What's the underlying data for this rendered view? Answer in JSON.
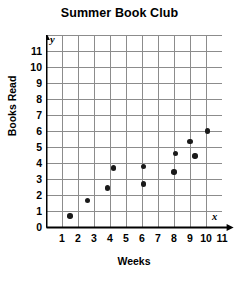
{
  "chart_data": {
    "type": "scatter",
    "title": "Summer Book Club",
    "xlabel": "Weeks",
    "ylabel": "Books Read",
    "xlim": [
      0,
      11.6
    ],
    "ylim": [
      0,
      11.6
    ],
    "grid": true,
    "legend": null,
    "x_axis_letter": "x",
    "y_axis_letter": "y",
    "origin_label": "0",
    "xticks": [
      1,
      2,
      3,
      4,
      5,
      6,
      7,
      8,
      9,
      10,
      11
    ],
    "xtick_labels": [
      "1",
      "2",
      "3",
      "4",
      "5",
      "6",
      "7",
      "8",
      "9",
      "10",
      "11"
    ],
    "yticks": [
      1,
      2,
      3,
      4,
      5,
      6,
      7,
      8,
      9,
      10,
      11
    ],
    "ytick_labels": [
      "1",
      "2",
      "3",
      "4",
      "5",
      "6",
      "7",
      "8",
      "9",
      "10",
      "11"
    ],
    "marker_color": "#1a1a1a",
    "grid_color": "#8c8c8c",
    "axis_color": "#000000",
    "points": [
      {
        "x": 1.5,
        "y": 0.7
      },
      {
        "x": 2.6,
        "y": 1.65
      },
      {
        "x": 3.85,
        "y": 2.45
      },
      {
        "x": 4.2,
        "y": 3.7
      },
      {
        "x": 6.1,
        "y": 2.7
      },
      {
        "x": 6.1,
        "y": 3.8
      },
      {
        "x": 8.0,
        "y": 3.45
      },
      {
        "x": 8.1,
        "y": 4.6
      },
      {
        "x": 9.0,
        "y": 5.35
      },
      {
        "x": 9.3,
        "y": 4.45
      },
      {
        "x": 10.1,
        "y": 6.0
      }
    ]
  }
}
